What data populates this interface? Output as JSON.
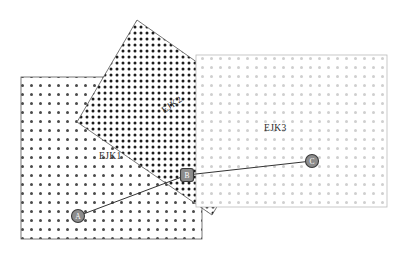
{
  "figure": {
    "width": 404,
    "height": 257,
    "background_color": "#ffffff"
  },
  "regions": [
    {
      "id": "ejk1",
      "label": "EJK1",
      "shape": "rectangle",
      "x": 21,
      "y": 77,
      "width": 181,
      "height": 162,
      "border_color": "#555555",
      "dot_color": "#4a4a4a",
      "dot_spacing": 9,
      "dot_radius": 1.5,
      "label_x": 99,
      "label_y": 152
    },
    {
      "id": "ejk2",
      "label": "EJK2",
      "shape": "rotated-square",
      "vertices": [
        [
          137,
          20
        ],
        [
          272,
          115
        ],
        [
          212,
          215
        ],
        [
          77,
          122
        ]
      ],
      "border_color": "#555555",
      "dot_color": "#1c1c1c",
      "dot_spacing": 6,
      "dot_radius": 1.5,
      "label_x": 163,
      "label_y": 107,
      "label_rotation_deg": -35
    },
    {
      "id": "ejk3",
      "label": "EJK3",
      "shape": "rectangle",
      "x": 196,
      "y": 55,
      "width": 191,
      "height": 152,
      "border_color": "#bbbbbb",
      "dot_color": "#cfcfcf",
      "dot_spacing": 9,
      "dot_radius": 1.5,
      "label_x": 264,
      "label_y": 124
    }
  ],
  "nodes": [
    {
      "id": "A",
      "label": "A",
      "shape": "circle",
      "cx": 78,
      "cy": 216,
      "r": 6.5,
      "fill": "#8c8c8c",
      "stroke": "#3a3a3a"
    },
    {
      "id": "B",
      "label": "B",
      "shape": "rounded-square",
      "cx": 187,
      "cy": 175,
      "size": 13,
      "fill": "#8c8c8c",
      "stroke": "#3a3a3a"
    },
    {
      "id": "C",
      "label": "C",
      "shape": "circle",
      "cx": 312,
      "cy": 161,
      "r": 6.5,
      "fill": "#8c8c8c",
      "stroke": "#3a3a3a"
    }
  ],
  "edges": [
    {
      "id": "edge-ab",
      "from": "A",
      "to": "B",
      "stroke": "#333333",
      "width": 1
    },
    {
      "id": "edge-bc",
      "from": "B",
      "to": "C",
      "stroke": "#333333",
      "width": 1
    }
  ],
  "chart_data": {
    "type": "diagram",
    "regions": [
      "EJK1",
      "EJK2",
      "EJK3"
    ],
    "nodes": [
      "A",
      "B",
      "C"
    ],
    "edges": [
      [
        "A",
        "B"
      ],
      [
        "B",
        "C"
      ]
    ]
  }
}
